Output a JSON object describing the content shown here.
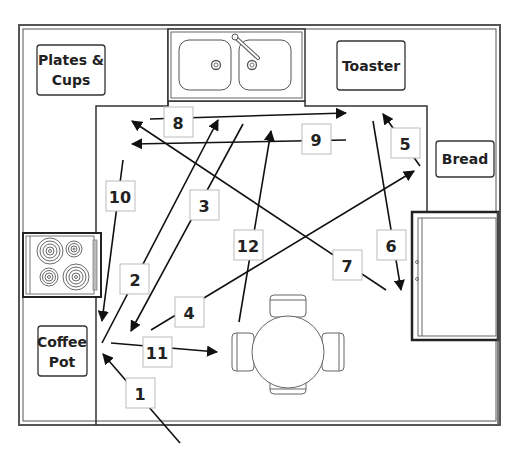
{
  "diagram": {
    "type": "kitchen-floor-plan",
    "appliances": {
      "plates": {
        "line1": "Plates &",
        "line2": "Cups"
      },
      "toaster": "Toaster",
      "bread": "Bread",
      "coffee": {
        "line1": "Coffee",
        "line2": "Pot"
      }
    },
    "fixtures": [
      "sink",
      "stove",
      "refrigerator",
      "table-with-4-chairs"
    ],
    "paths": [
      {
        "n": "1",
        "from": "entrance",
        "to": "coffee-pot"
      },
      {
        "n": "2",
        "from": "coffee-pot",
        "to": "sink"
      },
      {
        "n": "3",
        "from": "sink",
        "to": "coffee-area"
      },
      {
        "n": "4",
        "from": "coffee-area",
        "to": "bread"
      },
      {
        "n": "5",
        "from": "bread",
        "to": "toaster"
      },
      {
        "n": "6",
        "from": "toaster",
        "to": "refrigerator"
      },
      {
        "n": "7",
        "from": "refrigerator",
        "to": "plates-and-cups"
      },
      {
        "n": "8",
        "from": "plates-and-cups",
        "to": "toaster"
      },
      {
        "n": "9",
        "from": "toaster",
        "to": "plates-and-cups"
      },
      {
        "n": "10",
        "from": "plates-and-cups",
        "to": "coffee-pot"
      },
      {
        "n": "11",
        "from": "coffee-pot",
        "to": "table"
      },
      {
        "n": "12",
        "from": "table",
        "to": "sink"
      }
    ]
  }
}
